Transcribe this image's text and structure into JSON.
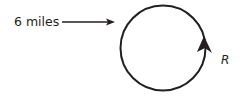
{
  "diagram": {
    "distance_label": "6 miles",
    "route_label": "R",
    "colors": {
      "stroke": "#231f20",
      "background": "#ffffff"
    },
    "shapes": {
      "circle": {
        "cx": 163,
        "cy": 48,
        "r": 43
      },
      "pointer_arrow": {
        "x1": 62,
        "x2": 114,
        "y": 22
      },
      "direction_arrow": "counterclockwise-up on right side"
    }
  }
}
